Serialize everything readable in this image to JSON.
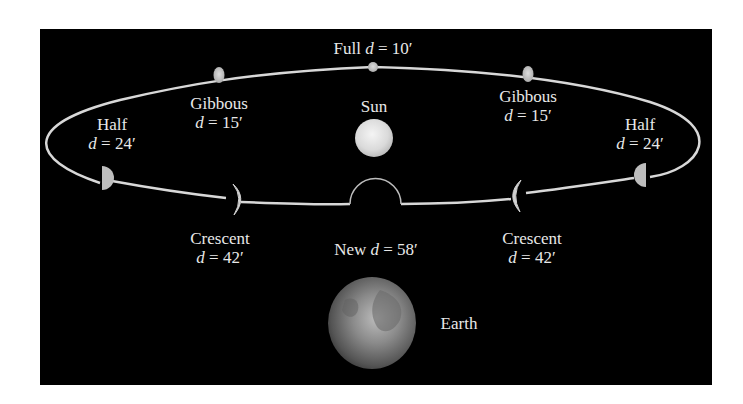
{
  "diagram": {
    "background_color": "#000000",
    "orbit_color": "#d8d8d8",
    "moon_color": "#c8c8c8",
    "sun_color": "#e6e6e6",
    "labels": {
      "full": {
        "phase": "Full",
        "var": "d",
        "eq": " = 10′"
      },
      "gibbous_left": {
        "phase": "Gibbous",
        "var": "d",
        "eq": " = 15′"
      },
      "gibbous_right": {
        "phase": "Gibbous",
        "var": "d",
        "eq": " = 15′"
      },
      "half_left": {
        "phase": "Half",
        "var": "d",
        "eq": " = 24′"
      },
      "half_right": {
        "phase": "Half",
        "var": "d",
        "eq": " = 24′"
      },
      "crescent_left": {
        "phase": "Crescent",
        "var": "d",
        "eq": " = 42′"
      },
      "crescent_right": {
        "phase": "Crescent",
        "var": "d",
        "eq": " = 42′"
      },
      "new": {
        "phase": "New",
        "var": "d",
        "eq": " = 58′"
      },
      "sun": "Sun",
      "earth": "Earth"
    }
  }
}
